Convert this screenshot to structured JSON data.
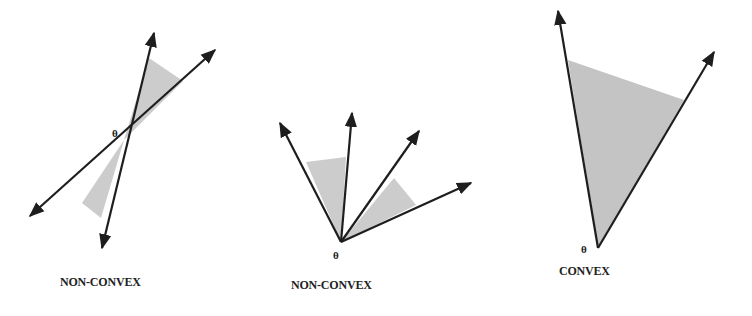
{
  "figure": {
    "panels": [
      {
        "label": "NON-CONVEX",
        "vertex_label": "θ"
      },
      {
        "label": "NON-CONVEX",
        "vertex_label": "θ"
      },
      {
        "label": "CONVEX",
        "vertex_label": "θ"
      }
    ],
    "colors": {
      "stroke": "#1e1e1e",
      "shade": "#c8c8c8",
      "background": "#ffffff"
    }
  }
}
